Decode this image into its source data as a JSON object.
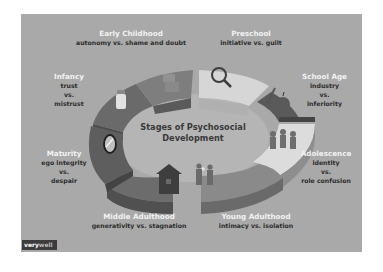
{
  "title": "Stages of Psychosocial Development",
  "title_lines": [
    "Stages of Psychosocial",
    "Development"
  ],
  "logo": {
    "bold": "very",
    "light": "well"
  },
  "stages": [
    {
      "name": "Infancy",
      "crisis_lines": [
        "trust",
        "vs.",
        "mistrust"
      ],
      "icon": "baby-bottle-icon"
    },
    {
      "name": "Early Childhood",
      "crisis_lines": [
        "autonomy vs. shame and doubt"
      ],
      "icon": "potty-chair-icon"
    },
    {
      "name": "Preschool",
      "crisis_lines": [
        "initiative vs. guilt"
      ],
      "icon": "magnifying-glass-icon"
    },
    {
      "name": "School Age",
      "crisis_lines": [
        "industry",
        "vs.",
        "inferiority"
      ],
      "icon": "pencil-apple-icon"
    },
    {
      "name": "Adolescence",
      "crisis_lines": [
        "identity",
        "vs.",
        "role confusion"
      ],
      "icon": "peer-group-icon"
    },
    {
      "name": "Young Adulthood",
      "crisis_lines": [
        "intimacy vs. isolation"
      ],
      "icon": "couple-heart-icon"
    },
    {
      "name": "Middle Adulthood",
      "crisis_lines": [
        "generativity vs. stagnation"
      ],
      "icon": "house-icon"
    },
    {
      "name": "Maturity",
      "crisis_lines": [
        "ego integrity",
        "vs.",
        "despair"
      ],
      "icon": "mirror-icon"
    }
  ],
  "colors": {
    "background": "#a9a9a9",
    "segment_dark": "#5e5e5e",
    "segment_mid": "#7a7a7a",
    "segment_light": "#d2d2d2",
    "stage_label": "#f2f2f2",
    "crisis_label": "#2d2d2d"
  }
}
